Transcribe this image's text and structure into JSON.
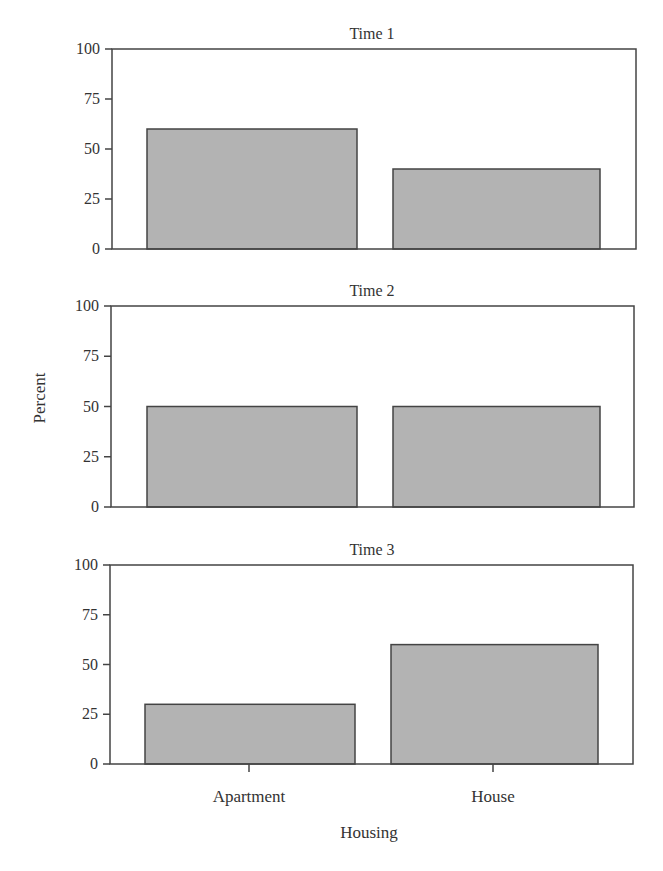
{
  "chart_data": {
    "type": "bar",
    "layout": "vertical-facets",
    "categories": [
      "Apartment",
      "House"
    ],
    "xlabel": "Housing",
    "ylabel": "Percent",
    "ylim": [
      0,
      100
    ],
    "yticks": [
      0,
      25,
      50,
      75,
      100
    ],
    "grid": false,
    "legend": null,
    "bar_color": "#b3b3b3",
    "panels": [
      {
        "title": "Time 1",
        "values": [
          60,
          40
        ]
      },
      {
        "title": "Time 2",
        "values": [
          50,
          50
        ]
      },
      {
        "title": "Time 3",
        "values": [
          30,
          60
        ]
      }
    ]
  },
  "labels": {
    "panel_titles": [
      "Time 1",
      "Time 2",
      "Time 3"
    ],
    "ytick_labels": [
      "0",
      "25",
      "50",
      "75",
      "100"
    ],
    "xtick_labels": [
      "Apartment",
      "House"
    ],
    "xlabel": "Housing",
    "ylabel": "Percent"
  }
}
